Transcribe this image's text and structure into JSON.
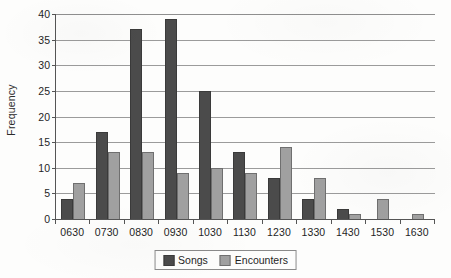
{
  "chart_data": {
    "type": "bar",
    "title": "",
    "xlabel": "",
    "ylabel": "Frequency",
    "categories": [
      "0630",
      "0730",
      "0830",
      "0930",
      "1030",
      "1130",
      "1230",
      "1330",
      "1430",
      "1530",
      "1630"
    ],
    "series": [
      {
        "name": "Songs",
        "color": "#4b4b4b",
        "values": [
          4,
          17,
          37,
          39,
          25,
          13,
          8,
          4,
          2,
          0,
          0
        ]
      },
      {
        "name": "Encounters",
        "color": "#a0a0a0",
        "values": [
          7,
          13,
          13,
          9,
          10,
          9,
          14,
          8,
          1,
          4,
          1
        ]
      }
    ],
    "ylim": [
      0,
      40
    ],
    "yticks": [
      0,
      5,
      10,
      15,
      20,
      25,
      30,
      35,
      40
    ],
    "ytick_labels": [
      "0",
      "5",
      "10",
      "15",
      "20",
      "25",
      "30",
      "35",
      "40"
    ],
    "grid": true,
    "legend_position": "bottom-center",
    "legend_entries": [
      "Songs",
      "Encounters"
    ]
  }
}
